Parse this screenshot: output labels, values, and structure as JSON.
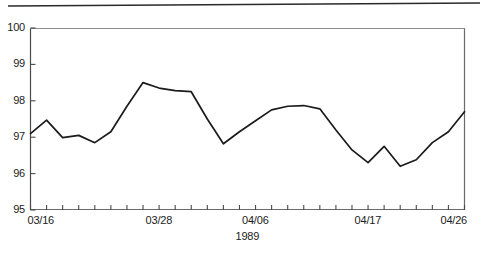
{
  "chart_data": {
    "type": "line",
    "title": "",
    "xlabel": "1989",
    "ylabel": "",
    "ylim": [
      95,
      100
    ],
    "ytick_labels": [
      "95",
      "96",
      "97",
      "98",
      "99",
      "100"
    ],
    "ytick_values": [
      95,
      96,
      97,
      98,
      99,
      100
    ],
    "xtick_labels": [
      "03/16",
      "03/28",
      "04/06",
      "04/17",
      "04/26"
    ],
    "xtick_label_indices": [
      0,
      8,
      14,
      21,
      27
    ],
    "x_tick_count": 28,
    "grid": false,
    "legend": null,
    "line_color": "#1b1b1b",
    "series": [
      {
        "name": "series-1",
        "x": [
          "03/16",
          "03/17",
          "03/18",
          "03/19",
          "03/20",
          "03/21",
          "03/22",
          "03/23",
          "03/28",
          "03/29",
          "03/30",
          "03/31",
          "04/01",
          "04/02",
          "04/06",
          "04/07",
          "04/08",
          "04/09",
          "04/10",
          "04/11",
          "04/12",
          "04/17",
          "04/18",
          "04/19",
          "04/20",
          "04/21",
          "04/22",
          "04/26"
        ],
        "values": [
          97.1,
          97.47,
          96.99,
          97.05,
          96.85,
          97.15,
          97.85,
          98.5,
          98.35,
          98.28,
          98.25,
          97.5,
          96.82,
          97.15,
          97.45,
          97.75,
          97.85,
          97.87,
          97.78,
          97.2,
          96.65,
          96.3,
          96.75,
          96.2,
          96.38,
          96.85,
          97.15,
          97.7
        ]
      }
    ]
  },
  "artifacts": {
    "top_rule": "scan-line-artifact"
  }
}
